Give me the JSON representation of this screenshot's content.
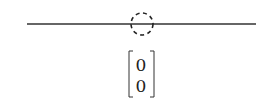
{
  "diagram": {
    "line": {
      "x1": 27,
      "x2": 256,
      "y": 24,
      "color": "#333333"
    },
    "circle": {
      "cx": 142,
      "cy": 24,
      "r": 11,
      "style": "dashed",
      "color": "#222222"
    },
    "matrix": {
      "entries": [
        "0",
        "0"
      ]
    }
  }
}
